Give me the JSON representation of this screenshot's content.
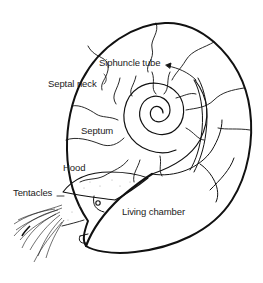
{
  "diagram": {
    "labels": {
      "siphuncle_tube": "Siphuncle tube",
      "septal_neck": "Septal neck",
      "septum": "Septum",
      "hood": "Hood",
      "tentacles": "Tentacles",
      "living_chamber": "Living chamber"
    },
    "colors": {
      "line": "#111111",
      "background": "#ffffff",
      "label": "#222222"
    }
  }
}
